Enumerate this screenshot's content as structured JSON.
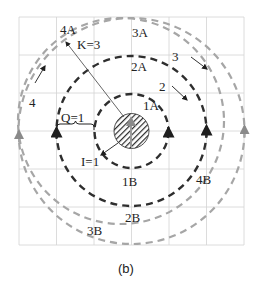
{
  "figure": {
    "caption": "(b)",
    "grid": {
      "cols": 6,
      "rows": 6,
      "color": "#d0d0d0"
    },
    "colors": {
      "dark_circle": "#2a2a2a",
      "light_circle": "#9a9a9a",
      "hatch": "#2a2a2a",
      "arrow_line": "#555555"
    },
    "circles": [
      {
        "id": "1",
        "top_label": "1A",
        "bottom_label": "1B"
      },
      {
        "id": "2",
        "top_label": "2A",
        "bottom_label": "2B",
        "side_label": "2"
      },
      {
        "id": "3",
        "top_label": "3A",
        "bottom_label": "3B",
        "side_label": "3"
      },
      {
        "id": "4",
        "top_label": "4A",
        "bottom_label": "4B",
        "side_label": "4"
      }
    ],
    "annotations": {
      "k": "K=3",
      "q": "Q=1",
      "i": "I=1"
    }
  }
}
